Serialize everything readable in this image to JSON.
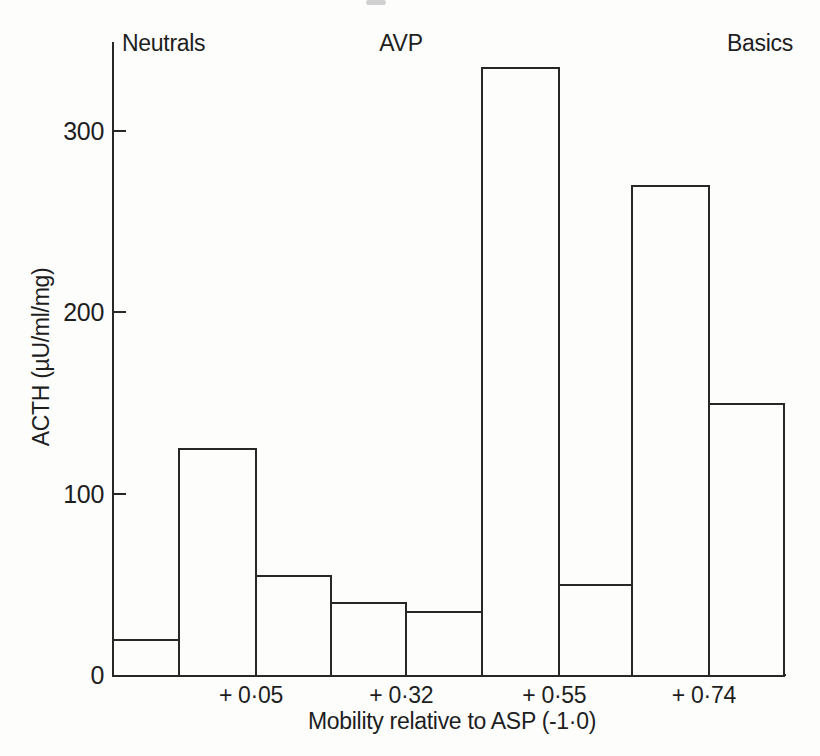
{
  "chart_data": {
    "type": "bar",
    "subtype": "histogram",
    "xlabel": "Mobility relative to ASP  (-1·0)",
    "ylabel": "ACTH (µU/ml/mg)",
    "yticks": [
      0,
      100,
      200,
      300
    ],
    "ylim": [
      0,
      350
    ],
    "grid": false,
    "legend": false,
    "values": [
      20,
      125,
      55,
      40,
      35,
      335,
      50,
      270,
      150
    ],
    "bin_edges_frac": [
      0,
      0.098,
      0.213,
      0.325,
      0.437,
      0.55,
      0.665,
      0.774,
      0.888,
      1
    ],
    "x_markers": [
      {
        "label": "+ 0·05",
        "edge_index": 2
      },
      {
        "label": "+ 0·32",
        "edge_index": 4
      },
      {
        "label": "+ 0·55",
        "edge_index": 6
      },
      {
        "label": "+ 0·74",
        "edge_index": 8
      }
    ],
    "annotations": [
      {
        "text": "Neutrals",
        "position": "left"
      },
      {
        "text": "AVP",
        "position": "center"
      },
      {
        "text": "Basics",
        "position": "right"
      }
    ]
  }
}
